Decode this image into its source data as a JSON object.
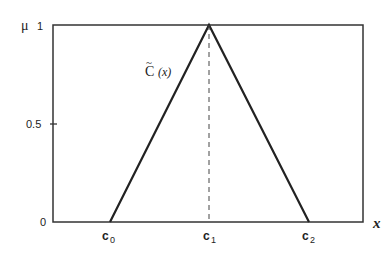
{
  "diagram": {
    "type": "triangular-membership-function",
    "y_axis_label": "μ",
    "x_axis_label": "x",
    "y_ticks": [
      "0",
      "0.5",
      "1"
    ],
    "x_ticks": [
      {
        "base": "c",
        "sub": "0"
      },
      {
        "base": "c",
        "sub": "1"
      },
      {
        "base": "c",
        "sub": "2"
      }
    ],
    "curve_label": {
      "base": "C",
      "accent": "~",
      "arg": "(x)"
    },
    "membership": {
      "c0": 0,
      "c1": 1,
      "c2": 0,
      "peak_value": 1
    }
  }
}
